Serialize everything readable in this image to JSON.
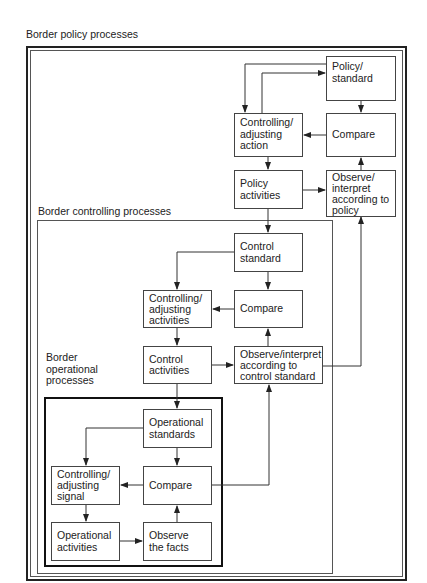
{
  "regions": {
    "policy": {
      "label": "Border policy processes"
    },
    "controlling": {
      "label": "Border controlling processes"
    },
    "operational": {
      "label": "Border\noperational\nprocesses"
    }
  },
  "nodes": {
    "policy_standard": "Policy/\nstandard",
    "policy_adjusting_action": "Controlling/\nadjusting\naction",
    "policy_compare": "Compare",
    "policy_activities": "Policy\nactivities",
    "policy_observe": "Observe/\ninterpret\naccording to\npolicy",
    "control_standard": "Control\nstandard",
    "control_adjusting_activities": "Controlling/\nadjusting\nactivities",
    "control_compare": "Compare",
    "control_activities": "Control\nactivities",
    "control_observe": "Observe/interpret\naccording to\ncontrol standard",
    "operational_standards": "Operational\nstandards",
    "operational_adjusting_signal": "Controlling/\nadjusting\nsignal",
    "operational_compare": "Compare",
    "operational_activities": "Operational\nactivities",
    "operational_observe": "Observe\nthe facts"
  },
  "colors": {
    "line": "#333333",
    "background": "#ffffff",
    "text": "#222222"
  }
}
